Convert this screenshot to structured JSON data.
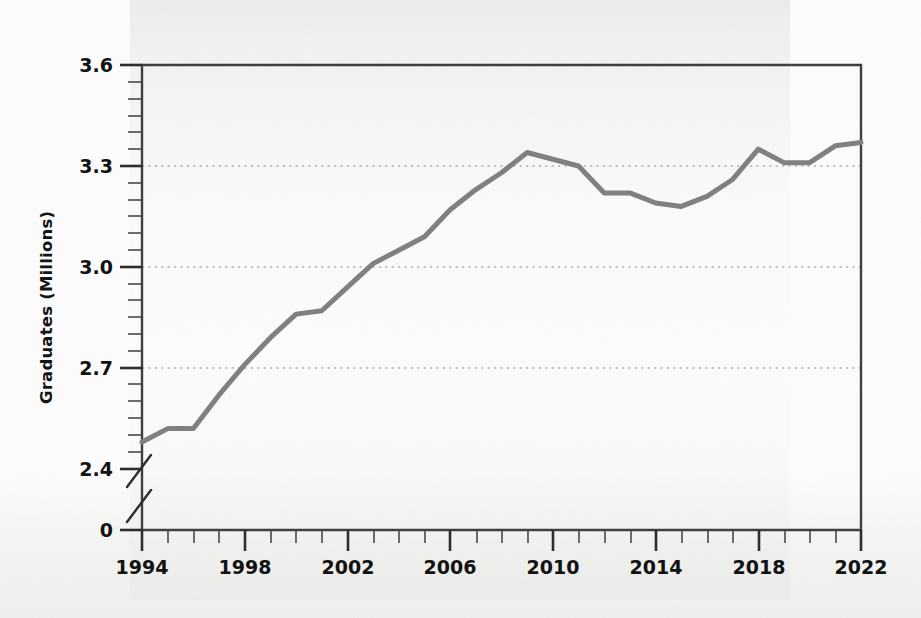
{
  "chart_data": {
    "type": "line",
    "title": "",
    "subtitle": "",
    "xlabel": "",
    "ylabel": "Graduates (Millions)",
    "grid": true,
    "gridlines_y": [
      2.7,
      3.0,
      3.3
    ],
    "legend": "none",
    "axis_break": {
      "axis": "y",
      "between": [
        0,
        2.4
      ],
      "style": "double-slash"
    },
    "xlim": [
      1994,
      2022
    ],
    "ylim": [
      2.34,
      3.6
    ],
    "y_ticks_major": [
      "0",
      "2.4",
      "2.7",
      "3.0",
      "3.3",
      "3.6"
    ],
    "y_tick_values": [
      0,
      2.4,
      2.7,
      3.0,
      3.3,
      3.6
    ],
    "y_minor_tick_step": 0.05,
    "x_ticks_major": [
      "1994",
      "1998",
      "2002",
      "2006",
      "2010",
      "2014",
      "2018",
      "2022"
    ],
    "x_tick_values": [
      1994,
      1998,
      2002,
      2006,
      2010,
      2014,
      2018,
      2022
    ],
    "x_minor_tick_step": 1,
    "line_color": "#808080",
    "line_width": 5,
    "x": [
      1994,
      1995,
      1996,
      1997,
      1998,
      1999,
      2000,
      2001,
      2002,
      2003,
      2004,
      2005,
      2006,
      2007,
      2008,
      2009,
      2010,
      2011,
      2012,
      2013,
      2014,
      2015,
      2016,
      2017,
      2018,
      2019,
      2020,
      2021,
      2022
    ],
    "values": [
      2.48,
      2.52,
      2.52,
      2.62,
      2.71,
      2.79,
      2.86,
      2.87,
      2.94,
      3.01,
      3.05,
      3.09,
      3.17,
      3.23,
      3.28,
      3.34,
      3.32,
      3.3,
      3.22,
      3.22,
      3.19,
      3.18,
      3.21,
      3.26,
      3.35,
      3.31,
      3.31,
      3.36,
      3.37
    ],
    "series": [
      {
        "name": "Graduates",
        "values": [
          2.48,
          2.52,
          2.52,
          2.62,
          2.71,
          2.79,
          2.86,
          2.87,
          2.94,
          3.01,
          3.05,
          3.09,
          3.17,
          3.23,
          3.28,
          3.34,
          3.32,
          3.3,
          3.22,
          3.22,
          3.19,
          3.18,
          3.21,
          3.26,
          3.35,
          3.31,
          3.31,
          3.36,
          3.37
        ]
      }
    ],
    "annotations": []
  },
  "axis": {
    "y_title": "Graduates (Millions)",
    "y_labels": [
      "3.6",
      "3.3",
      "3.0",
      "2.7",
      "2.4",
      "0"
    ],
    "x_labels": [
      "1994",
      "1998",
      "2002",
      "2006",
      "2010",
      "2014",
      "2018",
      "2022"
    ]
  },
  "colors": {
    "line": "#808080",
    "axis": "#3a3a3a",
    "grid": "#b9b9b9",
    "text": "#121212",
    "background": "#fdfdfd"
  }
}
